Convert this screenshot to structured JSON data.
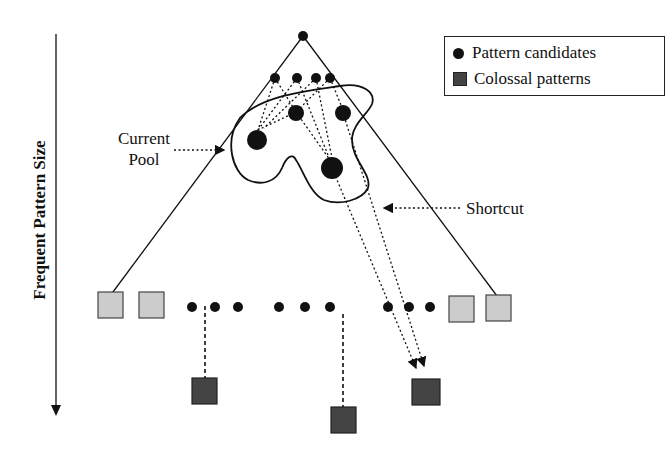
{
  "diagram": {
    "axis_label": "Frequent Pattern Size",
    "legend": {
      "items": [
        {
          "symbol": "circle",
          "label": "Pattern candidates"
        },
        {
          "symbol": "square",
          "label": "Colossal patterns"
        }
      ]
    },
    "annotations": {
      "current_pool_line1": "Current",
      "current_pool_line2": "Pool",
      "shortcut": "Shortcut"
    },
    "colors": {
      "stroke": "#111111",
      "candidate_fill": "#111111",
      "light_square": "#cccccc",
      "colossal_square": "#444444"
    }
  }
}
